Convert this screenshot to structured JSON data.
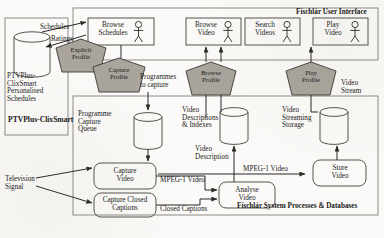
{
  "diagram": {
    "regions": {
      "user_interface": {
        "label": "Físchlár User Interface"
      },
      "system": {
        "label": "Físchlár System Processes & Databases"
      },
      "ptvplus": {
        "label": "PTVPlus-ClixSmart"
      }
    },
    "use_cases": [
      {
        "id": "browse-schedules",
        "label": "Browse\nSchedules"
      },
      {
        "id": "browse-video",
        "label": "Browse\nVideo"
      },
      {
        "id": "search-videos",
        "label": "Search\nVideos"
      },
      {
        "id": "play-video",
        "label": "Play\nVideo"
      }
    ],
    "profiles": [
      {
        "id": "explicit-profile",
        "label": "Explicit\nProfile"
      },
      {
        "id": "capture-profile",
        "label": "Capture\nProfile"
      },
      {
        "id": "browse-profile",
        "label": "Browse\nProfile"
      },
      {
        "id": "play-profile",
        "label": "Play\nProfile"
      }
    ],
    "datastores": [
      {
        "id": "ptvplus-schedules",
        "label": "PTVPlus-\nClixSmart\nPersonalised\nSchedules"
      },
      {
        "id": "programme-capture-queue",
        "label": "Programme\nCapture\nQueue"
      },
      {
        "id": "video-descriptions-indexes",
        "label": "Video\nDescriptions\n& Indexes"
      },
      {
        "id": "video-streaming-storage",
        "label": "Video\nStreaming\nStorage"
      }
    ],
    "processes": [
      {
        "id": "capture-video",
        "label": "Capture\nVideo"
      },
      {
        "id": "capture-closed-captions",
        "label": "Capture Closed\nCaptions"
      },
      {
        "id": "analyse-video",
        "label": "Analyse\nVideo"
      },
      {
        "id": "store-video",
        "label": "Store\nVideo"
      }
    ],
    "flows": [
      {
        "id": "schedules",
        "label": "Schedules"
      },
      {
        "id": "ratings",
        "label": "Ratings"
      },
      {
        "id": "programmes-to-capture",
        "label": "Programmes\nto capture"
      },
      {
        "id": "video-stream",
        "label": "Video\nStream"
      },
      {
        "id": "video-description",
        "label": "Video\nDescription"
      },
      {
        "id": "mpeg1-video-left",
        "label": "MPEG-1 Video"
      },
      {
        "id": "mpeg1-video-right",
        "label": "MPEG-1 Video"
      },
      {
        "id": "closed-captions",
        "label": "Closed Captions"
      },
      {
        "id": "television-signal",
        "label": "Television\nSignal"
      }
    ],
    "colors": {
      "profile_fill": "#a9a59c",
      "line": "#55524e",
      "region_border": "#8d8a85",
      "background": "#fbfaf8"
    }
  }
}
